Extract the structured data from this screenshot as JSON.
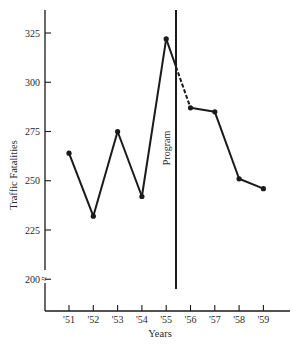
{
  "chart_data": {
    "type": "line",
    "title": "",
    "xlabel": "Years",
    "ylabel": "Traffic Fatalities",
    "categories": [
      "'51",
      "'52",
      "'53",
      "'54",
      "'55",
      "'56",
      "'57",
      "'58",
      "'59"
    ],
    "series": [
      {
        "name": "Traffic Fatalities",
        "values": [
          264,
          232,
          275,
          242,
          322,
          287,
          285,
          251,
          246
        ]
      }
    ],
    "ylim": [
      190,
      340
    ],
    "yticks": [
      200,
      225,
      250,
      275,
      300,
      325
    ],
    "ytick_labels": [
      "200",
      "225",
      "250",
      "275",
      "300",
      "325"
    ],
    "axis_break": "≈",
    "grid": false,
    "legend": null,
    "annotations": [
      {
        "type": "vertical-line",
        "label": "Program",
        "x_between": [
          "'55",
          "'56"
        ]
      },
      {
        "type": "dashed-segment",
        "from": "'55",
        "to": "'56",
        "note": "segment after program line drawn dashed"
      }
    ]
  }
}
